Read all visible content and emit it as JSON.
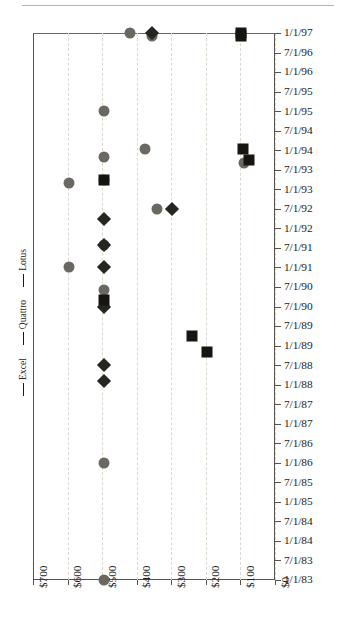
{
  "chart_data": {
    "type": "scatter",
    "title": "",
    "subtitle": "",
    "xlabel": "",
    "ylabel": "",
    "orientation": "horizontal-price-vs-date",
    "grid": true,
    "legend_position": "left-rotated",
    "x_axis": {
      "label": "",
      "tick_labels": [
        "$700",
        "$600",
        "$500",
        "$400",
        "$300",
        "$200",
        "$100",
        "$0"
      ],
      "tick_values": [
        700,
        600,
        500,
        400,
        300,
        200,
        100,
        0
      ],
      "reversed": true,
      "xlim": [
        700,
        0
      ]
    },
    "y_axis": {
      "label": "",
      "side": "right",
      "tick_labels": [
        "1/1/97",
        "7/1/96",
        "1/1/96",
        "7/1/95",
        "1/1/95",
        "7/1/94",
        "1/1/94",
        "7/1/93",
        "1/1/93",
        "7/1/92",
        "1/1/92",
        "7/1/91",
        "1/1/91",
        "7/1/90",
        "7/1/90",
        "7/1/89",
        "1/1/89",
        "7/1/88",
        "1/1/88",
        "7/1/87",
        "1/1/87",
        "7/1/86",
        "1/1/86",
        "7/1/85",
        "1/1/85",
        "7/1/84",
        "1/1/84",
        "7/1/83",
        "1/1/83"
      ]
    },
    "series": [
      {
        "name": "Excel",
        "marker": "square",
        "color": "#16150f",
        "points": [
          {
            "price": 99,
            "date": "1/1/97"
          },
          {
            "price": 99,
            "date": "12/1/96"
          },
          {
            "price": 92,
            "date": "1/15/94"
          },
          {
            "price": 75,
            "date": "10/1/93"
          },
          {
            "price": 495,
            "date": "4/1/93"
          },
          {
            "price": 495,
            "date": "3/1/90"
          },
          {
            "price": 239,
            "date": "4/1/89"
          },
          {
            "price": 198,
            "date": "11/1/88"
          }
        ]
      },
      {
        "name": "Quattro",
        "marker": "diamond",
        "color": "#272520",
        "points": [
          {
            "price": 355,
            "date": "1/1/97"
          },
          {
            "price": 299,
            "date": "7/1/92"
          },
          {
            "price": 495,
            "date": "4/1/92"
          },
          {
            "price": 495,
            "date": "8/1/91"
          },
          {
            "price": 495,
            "date": "1/1/91"
          },
          {
            "price": 495,
            "date": "1/1/90"
          },
          {
            "price": 495,
            "date": "7/1/88"
          },
          {
            "price": 495,
            "date": "2/1/88"
          }
        ]
      },
      {
        "name": "Lotus",
        "marker": "circle",
        "color": "#6b6862",
        "points": [
          {
            "price": 418,
            "date": "1/1/97"
          },
          {
            "price": 355,
            "date": "12/1/96"
          },
          {
            "price": 495,
            "date": "1/1/95"
          },
          {
            "price": 375,
            "date": "1/15/94"
          },
          {
            "price": 495,
            "date": "11/1/93"
          },
          {
            "price": 89,
            "date": "9/1/93"
          },
          {
            "price": 595,
            "date": "3/1/93"
          },
          {
            "price": 495,
            "date": "4/1/93"
          },
          {
            "price": 340,
            "date": "7/1/92"
          },
          {
            "price": 495,
            "date": "8/1/91"
          },
          {
            "price": 595,
            "date": "1/1/91"
          },
          {
            "price": 495,
            "date": "6/1/90"
          },
          {
            "price": 495,
            "date": "1/1/86"
          },
          {
            "price": 495,
            "date": "1/1/83"
          }
        ]
      }
    ]
  },
  "legend": {
    "entries": [
      {
        "label": "Excel",
        "key": "excel-marker-icon"
      },
      {
        "label": "Quattro",
        "key": "quattro-marker-icon"
      },
      {
        "label": "Lotus",
        "key": "lotus-marker-icon"
      }
    ]
  }
}
